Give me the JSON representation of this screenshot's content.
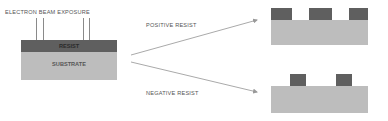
{
  "diagram": {
    "title_label": "ELECTRON BEAM EXPOSURE",
    "initial": {
      "resist_label": "RESIST",
      "substrate_label": "SUBSTRATE"
    },
    "branches": [
      {
        "label": "POSITIVE RESIST"
      },
      {
        "label": "NEGATIVE RESIST"
      }
    ],
    "colors": {
      "resist": "#5f5f5f",
      "substrate": "#bdbdbd",
      "arrow": "#999999",
      "text": "#555555"
    }
  }
}
